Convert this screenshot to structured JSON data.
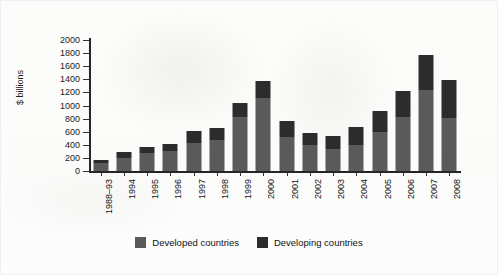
{
  "chart_data": {
    "type": "bar",
    "subtype": "stacked",
    "title": "",
    "xlabel": "",
    "ylabel": "$ billions",
    "ylim": [
      0,
      2000
    ],
    "yticks": [
      0,
      200,
      400,
      600,
      800,
      1000,
      1200,
      1400,
      1600,
      1800,
      2000
    ],
    "grid": false,
    "legend_position": "bottom-center",
    "categories": [
      "1988–93",
      "1994",
      "1995",
      "1996",
      "1997",
      "1998",
      "1999",
      "2000",
      "2001",
      "2002",
      "2003",
      "2004",
      "2005",
      "2006",
      "2007",
      "2008"
    ],
    "series": [
      {
        "name": "Developed countries",
        "color": "#5a5a5a",
        "values": [
          120,
          200,
          270,
          300,
          430,
          470,
          820,
          1120,
          520,
          400,
          340,
          400,
          600,
          820,
          1230,
          810
        ]
      },
      {
        "name": "Developing countries",
        "color": "#2c2c2c",
        "values": [
          50,
          90,
          100,
          110,
          180,
          190,
          220,
          250,
          250,
          180,
          190,
          270,
          310,
          400,
          540,
          580
        ]
      }
    ],
    "totals": [
      170,
      290,
      370,
      410,
      610,
      660,
      1040,
      1370,
      770,
      580,
      530,
      670,
      910,
      1220,
      1770,
      1390
    ]
  },
  "legend": {
    "items": [
      {
        "label": "Developed countries",
        "color": "#5a5a5a"
      },
      {
        "label": "Developing countries",
        "color": "#2c2c2c"
      }
    ]
  }
}
